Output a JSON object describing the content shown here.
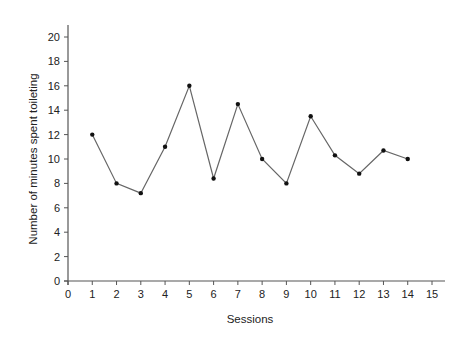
{
  "chart_data": {
    "type": "line",
    "title": "",
    "xlabel": "Sessions",
    "ylabel": "Number of minutes spent toileting",
    "xlim": [
      0,
      15
    ],
    "ylim": [
      0,
      20
    ],
    "x_ticks": [
      0,
      1,
      2,
      3,
      4,
      5,
      6,
      7,
      8,
      9,
      10,
      11,
      12,
      13,
      14,
      15
    ],
    "y_ticks": [
      0,
      2,
      4,
      6,
      8,
      10,
      12,
      14,
      16,
      18,
      20
    ],
    "grid": false,
    "legend": null,
    "series": [
      {
        "name": "Minutes spent toileting",
        "x": [
          1,
          2,
          3,
          4,
          5,
          6,
          7,
          8,
          9,
          10,
          11,
          12,
          13,
          14
        ],
        "values": [
          12,
          8,
          7.2,
          11,
          16,
          8.4,
          14.5,
          10,
          8,
          13.5,
          10.3,
          8.8,
          10.7,
          10
        ]
      }
    ]
  },
  "style": {
    "axis_color": "#555555",
    "line_color": "#666666",
    "marker_color": "#111111"
  }
}
